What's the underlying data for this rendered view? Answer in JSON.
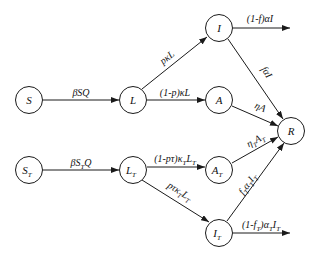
{
  "diagram": {
    "type": "compartmental-model",
    "nodes": [
      {
        "id": "S",
        "label": "S",
        "sub": ""
      },
      {
        "id": "L",
        "label": "L",
        "sub": ""
      },
      {
        "id": "I",
        "label": "I",
        "sub": ""
      },
      {
        "id": "A",
        "label": "A",
        "sub": ""
      },
      {
        "id": "R",
        "label": "R",
        "sub": ""
      },
      {
        "id": "ST",
        "label": "S",
        "sub": "T"
      },
      {
        "id": "LT",
        "label": "L",
        "sub": "T"
      },
      {
        "id": "AT",
        "label": "A",
        "sub": "T"
      },
      {
        "id": "IT",
        "label": "I",
        "sub": "T"
      }
    ],
    "edges": [
      {
        "from": "S",
        "to": "L",
        "label": "βSQ"
      },
      {
        "from": "L",
        "to": "I",
        "label": "pκL"
      },
      {
        "from": "L",
        "to": "A",
        "label": "(1-p)κL"
      },
      {
        "from": "I",
        "to": "out",
        "label": "(1-f)αI"
      },
      {
        "from": "I",
        "to": "R",
        "label": "fαI"
      },
      {
        "from": "A",
        "to": "R",
        "label": "ηA"
      },
      {
        "from": "ST",
        "to": "LT",
        "label": "βS_TQ"
      },
      {
        "from": "LT",
        "to": "AT",
        "label": "(1-pτ)κ_TL_T"
      },
      {
        "from": "LT",
        "to": "IT",
        "label": "pτκ_TL_T"
      },
      {
        "from": "AT",
        "to": "R",
        "label": "η_TA_T"
      },
      {
        "from": "IT",
        "to": "R",
        "label": "f_Tα_TI_T"
      },
      {
        "from": "IT",
        "to": "out",
        "label": "(1-f_T)α_TI_T"
      }
    ]
  },
  "labels": {
    "S": "S",
    "L": "L",
    "I": "I",
    "A": "A",
    "R": "R",
    "ST_main": "S",
    "ST_sub": "T",
    "LT_main": "L",
    "LT_sub": "T",
    "AT_main": "A",
    "AT_sub": "T",
    "IT_main": "I",
    "IT_sub": "T",
    "e_S_L": "βSQ",
    "e_L_I": "pκL",
    "e_L_A": "(1-p)κL",
    "e_I_out": "(1-f)αI",
    "e_I_R": "fαI",
    "e_A_R": "ηA",
    "e_ST_LT_a": "βS",
    "e_ST_LT_b": "T",
    "e_ST_LT_c": "Q",
    "e_LT_AT_a": "(1-pτ)κ",
    "e_LT_AT_b": "T",
    "e_LT_AT_c": "L",
    "e_LT_AT_d": "T",
    "e_LT_IT_a": "pτκ",
    "e_LT_IT_b": "T",
    "e_LT_IT_c": "L",
    "e_LT_IT_d": "T",
    "e_AT_R_a": "η",
    "e_AT_R_b": "T",
    "e_AT_R_c": "A",
    "e_AT_R_d": "T",
    "e_IT_R_a": "f",
    "e_IT_R_b": "T",
    "e_IT_R_c": "α",
    "e_IT_R_d": "T",
    "e_IT_R_e": "I",
    "e_IT_R_f": "T",
    "e_IT_out_a": "(1-f",
    "e_IT_out_b": "T",
    "e_IT_out_c": ")α",
    "e_IT_out_d": "T",
    "e_IT_out_e": "I",
    "e_IT_out_f": "T"
  }
}
